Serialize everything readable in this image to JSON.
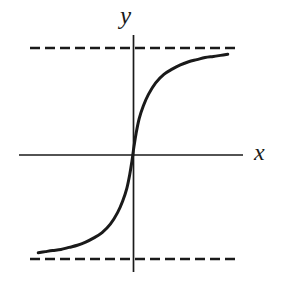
{
  "figure": {
    "background_color": "#ffffff",
    "ink_color": "#1a1a1a"
  },
  "labels": {
    "y_axis": "y",
    "x_axis": "x"
  },
  "chart_data": {
    "type": "line",
    "title": "",
    "subtitle": "",
    "xlabel": "x",
    "ylabel": "y",
    "grid": false,
    "legend": false,
    "legend_position": "none",
    "axes": {
      "x_axis": {
        "label": "x",
        "ticks": [],
        "tick_labels": [],
        "origin_px": 133,
        "y_px": 155,
        "x_start_px": 19,
        "x_end_px": 243
      },
      "y_axis": {
        "label": "y",
        "ticks": [],
        "tick_labels": [],
        "origin_px": 155,
        "x_px": 133,
        "y_start_px": 35,
        "y_end_px": 272
      }
    },
    "xlim": [
      -1.0,
      1.0
    ],
    "ylim": [
      -1.15,
      1.15
    ],
    "series": [
      {
        "name": "sigmoid",
        "style": "solid",
        "width": 3,
        "color": "#1a1a1a",
        "x": [
          -0.92,
          -0.85,
          -0.78,
          -0.7,
          -0.62,
          -0.54,
          -0.46,
          -0.38,
          -0.3,
          -0.22,
          -0.15,
          -0.1,
          -0.06,
          -0.03,
          -0.01,
          0.0,
          0.01,
          0.03,
          0.06,
          0.1,
          0.15,
          0.22,
          0.3,
          0.38,
          0.46,
          0.54,
          0.62,
          0.7,
          0.78,
          0.85,
          0.92
        ],
        "y": [
          -0.94,
          -0.93,
          -0.92,
          -0.91,
          -0.89,
          -0.87,
          -0.84,
          -0.8,
          -0.75,
          -0.67,
          -0.56,
          -0.45,
          -0.33,
          -0.19,
          -0.07,
          0.0,
          0.07,
          0.19,
          0.33,
          0.45,
          0.56,
          0.67,
          0.75,
          0.8,
          0.84,
          0.87,
          0.89,
          0.91,
          0.92,
          0.93,
          0.94
        ]
      }
    ],
    "asymptotes": [
      {
        "name": "upper-asymptote",
        "orientation": "horizontal",
        "value": 1.0,
        "style": "dashed",
        "y_px": 48,
        "x_start_px": 30,
        "x_end_px": 236
      },
      {
        "name": "lower-asymptote",
        "orientation": "horizontal",
        "value": -1.0,
        "style": "dashed",
        "y_px": 259,
        "x_start_px": 30,
        "x_end_px": 236
      }
    ],
    "annotations": []
  }
}
